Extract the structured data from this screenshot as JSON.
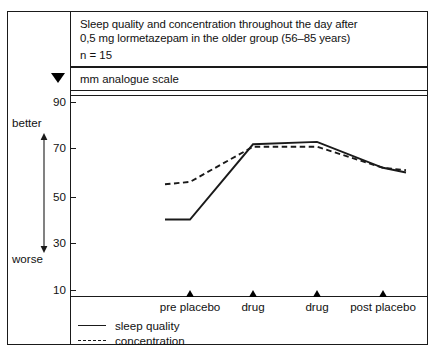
{
  "figure": {
    "title_line1": "Sleep quality and concentration throughout the day after",
    "title_line2": "0,5 mg lormetazepam in the older group (56–85 years)",
    "sample_size": "n = 15",
    "scale_label": "mm analogue scale",
    "scale_marker_icon": "down-triangle-icon"
  },
  "gutter": {
    "top_label": "better",
    "bottom_label": "worse",
    "arrow_icon": "double-headed-vertical-arrow-icon"
  },
  "colors": {
    "ink": "#1a1a1a",
    "paper": "#ffffff"
  },
  "chart_data": {
    "type": "line",
    "title": "Sleep quality and concentration throughout the day after 0,5 mg lormetazepam in the older group (56–85 years)",
    "subtitle": "n = 15",
    "xlabel": "",
    "ylabel": "mm analogue scale",
    "ylim": [
      0,
      100
    ],
    "yticks": [
      90,
      70,
      50,
      30,
      10
    ],
    "ytick_labels": [
      "90",
      "70",
      "50",
      "30",
      "10"
    ],
    "grid": false,
    "legend_position": "bottom-left",
    "x_markers": [
      "pre placebo",
      "drug",
      "drug",
      "post placebo"
    ],
    "x": [
      0,
      1,
      2,
      3,
      4,
      5
    ],
    "x_marker_indices": [
      1,
      2,
      3,
      4
    ],
    "series": [
      {
        "name": "sleep quality",
        "style": "solid",
        "values": [
          40,
          40,
          72,
          73,
          62,
          60
        ]
      },
      {
        "name": "concentration",
        "style": "dashed",
        "values": [
          55,
          56,
          71,
          71,
          62,
          61
        ]
      }
    ],
    "axis_direction_note": "better at top, worse at bottom"
  }
}
